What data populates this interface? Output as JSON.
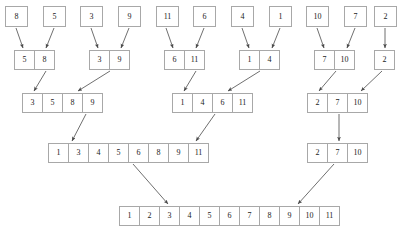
{
  "diagram": {
    "box_border_color": "#a8a8a8",
    "arrow_color": "#4a4a4a",
    "text_color": "#1a1a1a",
    "caption": "",
    "levels": [
      {
        "level": 1,
        "name": "singletons",
        "y": 6,
        "cell_w": 23,
        "cell_h": 21,
        "arrays": [
          {
            "x": 5,
            "values": [
              "8"
            ]
          },
          {
            "x": 43,
            "values": [
              "5"
            ]
          },
          {
            "x": 80,
            "values": [
              "3"
            ]
          },
          {
            "x": 118,
            "values": [
              "9"
            ]
          },
          {
            "x": 156,
            "values": [
              "11"
            ]
          },
          {
            "x": 193,
            "values": [
              "6"
            ]
          },
          {
            "x": 231,
            "values": [
              "4"
            ]
          },
          {
            "x": 269,
            "values": [
              "1"
            ]
          },
          {
            "x": 306,
            "values": [
              "10"
            ]
          },
          {
            "x": 344,
            "values": [
              "7"
            ]
          },
          {
            "x": 374,
            "values": [
              "2"
            ]
          }
        ]
      },
      {
        "level": 2,
        "name": "pairs-merged",
        "y": 50,
        "cell_w": 21,
        "cell_h": 20,
        "arrays": [
          {
            "x": 14,
            "values": [
              "5",
              "8"
            ]
          },
          {
            "x": 89,
            "values": [
              "3",
              "9"
            ]
          },
          {
            "x": 164,
            "values": [
              "6",
              "11"
            ]
          },
          {
            "x": 239,
            "values": [
              "1",
              "4"
            ]
          },
          {
            "x": 314,
            "values": [
              "7",
              "10"
            ]
          },
          {
            "x": 374,
            "values": [
              "2"
            ]
          }
        ]
      },
      {
        "level": 3,
        "name": "quads-merged",
        "y": 93,
        "cell_w": 21,
        "cell_h": 20,
        "arrays": [
          {
            "x": 22,
            "values": [
              "3",
              "5",
              "8",
              "9"
            ]
          },
          {
            "x": 172,
            "values": [
              "1",
              "4",
              "6",
              "11"
            ]
          },
          {
            "x": 307,
            "values": [
              "2",
              "7",
              "10"
            ]
          }
        ]
      },
      {
        "level": 4,
        "name": "halves-merged",
        "y": 143,
        "cell_w": 21,
        "cell_h": 20,
        "arrays": [
          {
            "x": 48,
            "values": [
              "1",
              "3",
              "4",
              "5",
              "6",
              "8",
              "9",
              "11"
            ]
          },
          {
            "x": 307,
            "values": [
              "2",
              "7",
              "10"
            ]
          }
        ]
      },
      {
        "level": 5,
        "name": "final-sorted",
        "y": 206,
        "cell_w": 21,
        "cell_h": 20,
        "arrays": [
          {
            "x": 119,
            "values": [
              "1",
              "2",
              "3",
              "4",
              "5",
              "6",
              "7",
              "8",
              "9",
              "10",
              "11"
            ]
          }
        ]
      }
    ],
    "arrows": [
      {
        "name": "arrow-8-to-pair-1",
        "x1": 16,
        "y1": 28,
        "x2": 23,
        "y2": 48
      },
      {
        "name": "arrow-5-to-pair-1",
        "x1": 54,
        "y1": 28,
        "x2": 46,
        "y2": 48
      },
      {
        "name": "arrow-3-to-pair-2",
        "x1": 91,
        "y1": 28,
        "x2": 98,
        "y2": 48
      },
      {
        "name": "arrow-9-to-pair-2",
        "x1": 129,
        "y1": 28,
        "x2": 121,
        "y2": 48
      },
      {
        "name": "arrow-11-to-pair-3",
        "x1": 166,
        "y1": 28,
        "x2": 173,
        "y2": 48
      },
      {
        "name": "arrow-6-to-pair-3",
        "x1": 204,
        "y1": 28,
        "x2": 196,
        "y2": 48
      },
      {
        "name": "arrow-4-to-pair-4",
        "x1": 242,
        "y1": 28,
        "x2": 249,
        "y2": 48
      },
      {
        "name": "arrow-1-to-pair-4",
        "x1": 280,
        "y1": 28,
        "x2": 272,
        "y2": 48
      },
      {
        "name": "arrow-10-to-pair-5",
        "x1": 317,
        "y1": 28,
        "x2": 324,
        "y2": 48
      },
      {
        "name": "arrow-7-to-pair-5",
        "x1": 355,
        "y1": 28,
        "x2": 347,
        "y2": 48
      },
      {
        "name": "arrow-2-to-single-6",
        "x1": 385,
        "y1": 28,
        "x2": 385,
        "y2": 48
      },
      {
        "name": "arrow-pair1-to-quad1",
        "x1": 46,
        "y1": 71,
        "x2": 34,
        "y2": 91
      },
      {
        "name": "arrow-pair2-to-quad1",
        "x1": 110,
        "y1": 71,
        "x2": 78,
        "y2": 91
      },
      {
        "name": "arrow-pair3-to-quad2",
        "x1": 196,
        "y1": 71,
        "x2": 184,
        "y2": 91
      },
      {
        "name": "arrow-pair4-to-quad2",
        "x1": 260,
        "y1": 71,
        "x2": 228,
        "y2": 91
      },
      {
        "name": "arrow-pair5-to-quad3",
        "x1": 336,
        "y1": 71,
        "x2": 319,
        "y2": 91
      },
      {
        "name": "arrow-single6-to-quad3",
        "x1": 382,
        "y1": 71,
        "x2": 361,
        "y2": 91
      },
      {
        "name": "arrow-quad1-to-half1",
        "x1": 86,
        "y1": 114,
        "x2": 72,
        "y2": 141
      },
      {
        "name": "arrow-quad2-to-half1",
        "x1": 215,
        "y1": 114,
        "x2": 196,
        "y2": 141
      },
      {
        "name": "arrow-quad3-to-copy",
        "x1": 339,
        "y1": 114,
        "x2": 339,
        "y2": 141
      },
      {
        "name": "arrow-half1-to-final",
        "x1": 133,
        "y1": 164,
        "x2": 168,
        "y2": 204
      },
      {
        "name": "arrow-half2-to-final",
        "x1": 334,
        "y1": 164,
        "x2": 298,
        "y2": 204
      }
    ]
  }
}
